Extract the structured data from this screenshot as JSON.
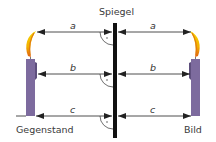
{
  "diagram": {
    "title": "Spiegel",
    "object_label": "Gegenstand",
    "image_label": "Bild",
    "distances": [
      {
        "label": "a",
        "row": "flame"
      },
      {
        "label": "b",
        "row": "middle"
      },
      {
        "label": "c",
        "row": "base"
      }
    ],
    "colors": {
      "mirror": "#111111",
      "candle": "#7d6b9e",
      "candle_dark": "#5e4f7d",
      "flame_outer": "#f2c200",
      "flame_inner": "#e07a10",
      "line": "#222222",
      "text": "#3a3a3a"
    }
  }
}
